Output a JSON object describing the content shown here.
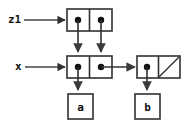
{
  "diagram": {
    "background_color": "#ffffff",
    "stroke_color": "#303030",
    "text_color": "#111111",
    "variables": [
      {
        "id": "z1",
        "label": "z1",
        "points_to": "cell-top"
      },
      {
        "id": "x",
        "label": "x",
        "points_to": "cell-middle"
      }
    ],
    "cons_cells": [
      {
        "id": "cell-top",
        "car": {
          "kind": "pointer",
          "target": "cell-middle"
        },
        "cdr": {
          "kind": "pointer",
          "target": "cell-middle"
        }
      },
      {
        "id": "cell-middle",
        "car": {
          "kind": "pointer",
          "target": "atom-a"
        },
        "cdr": {
          "kind": "pointer",
          "target": "cell-right"
        }
      },
      {
        "id": "cell-right",
        "car": {
          "kind": "pointer",
          "target": "atom-b"
        },
        "cdr": {
          "kind": "nil",
          "marker": "diagonal-slash"
        }
      }
    ],
    "atoms": [
      {
        "id": "atom-a",
        "label": "a"
      },
      {
        "id": "atom-b",
        "label": "b"
      }
    ]
  }
}
